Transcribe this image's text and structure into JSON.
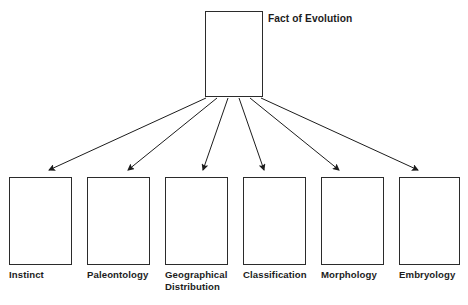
{
  "diagram": {
    "title": "Fact of Evolution",
    "background_color": "#ffffff",
    "line_color": "#2b2b2b",
    "text_color": "#1c1c1c",
    "root": {
      "label": "Fact of Evolution",
      "box": {
        "x": 205,
        "y": 11,
        "width": 58,
        "height": 86
      },
      "label_position": {
        "x": 268,
        "y": 13
      }
    },
    "branches": [
      {
        "label": "Instinct",
        "box": {
          "x": 9,
          "y": 177,
          "width": 63,
          "height": 88
        },
        "label_position": {
          "x": 9,
          "y": 269
        },
        "arrow": {
          "x1": 206,
          "y1": 98,
          "x2": 49,
          "y2": 170
        }
      },
      {
        "label": "Paleontology",
        "box": {
          "x": 87,
          "y": 177,
          "width": 63,
          "height": 88
        },
        "label_position": {
          "x": 87,
          "y": 269
        },
        "arrow": {
          "x1": 217,
          "y1": 98,
          "x2": 128,
          "y2": 170
        }
      },
      {
        "label": "Geographical\nDistribution",
        "box": {
          "x": 165,
          "y": 177,
          "width": 63,
          "height": 88
        },
        "label_position": {
          "x": 165,
          "y": 269
        },
        "arrow": {
          "x1": 228,
          "y1": 98,
          "x2": 203,
          "y2": 170
        }
      },
      {
        "label": "Classification",
        "box": {
          "x": 243,
          "y": 177,
          "width": 63,
          "height": 88
        },
        "label_position": {
          "x": 243,
          "y": 269
        },
        "arrow": {
          "x1": 239,
          "y1": 98,
          "x2": 264,
          "y2": 170
        }
      },
      {
        "label": "Morphology",
        "box": {
          "x": 321,
          "y": 177,
          "width": 63,
          "height": 88
        },
        "label_position": {
          "x": 321,
          "y": 269
        },
        "arrow": {
          "x1": 250,
          "y1": 98,
          "x2": 339,
          "y2": 170
        }
      },
      {
        "label": "Embryology",
        "box": {
          "x": 399,
          "y": 177,
          "width": 61,
          "height": 88
        },
        "label_position": {
          "x": 399,
          "y": 269
        },
        "arrow": {
          "x1": 261,
          "y1": 98,
          "x2": 418,
          "y2": 170
        }
      }
    ]
  }
}
